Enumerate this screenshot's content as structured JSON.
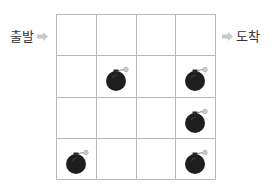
{
  "labels": {
    "start": "출발",
    "end": "도착"
  },
  "grid": {
    "rows": 4,
    "cols": 4,
    "line_color": "#b8b8b8",
    "cells": [
      [
        false,
        false,
        false,
        false
      ],
      [
        false,
        true,
        false,
        true
      ],
      [
        false,
        false,
        false,
        true
      ],
      [
        true,
        false,
        false,
        true
      ]
    ]
  },
  "icons": {
    "bomb": "bomb-icon",
    "arrow": "arrow-right-icon"
  },
  "colors": {
    "arrow": "#c8c8c8",
    "bomb_body": "#1e1e1e",
    "text": "#333333"
  }
}
